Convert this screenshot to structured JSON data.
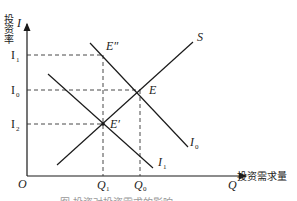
{
  "diagram": {
    "y_axis": {
      "label_cn": "投资率",
      "symbol": "I"
    },
    "x_axis": {
      "label_cn": "投资需求量",
      "symbol": "Q"
    },
    "origin": "O",
    "y_ticks": [
      {
        "label": "I",
        "sub": "1",
        "y": 55
      },
      {
        "label": "I",
        "sub": "0",
        "y": 90
      },
      {
        "label": "I",
        "sub": "2",
        "y": 124
      }
    ],
    "x_ticks": [
      {
        "label": "Q",
        "sub": "1",
        "x": 103
      },
      {
        "label": "Q",
        "sub": "0",
        "x": 140
      }
    ],
    "curves": {
      "S": {
        "label": "S"
      },
      "I0": {
        "label": "I",
        "sub": "0"
      },
      "I1": {
        "label": "I",
        "sub": "1"
      }
    },
    "points": {
      "E_double_prime": {
        "label": "E″"
      },
      "E": {
        "label": "E"
      },
      "E_prime": {
        "label": "E′"
      }
    },
    "caption": "图 投资对投资需求的影响",
    "colors": {
      "line": "#1a1a1a",
      "dash": "#333333",
      "text": "#222222"
    }
  }
}
